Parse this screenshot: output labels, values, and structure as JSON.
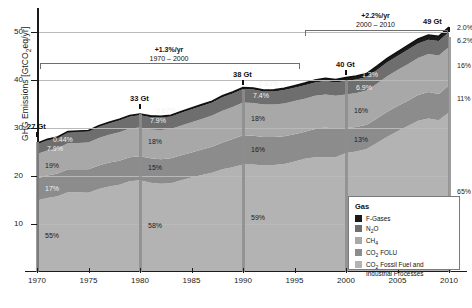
{
  "chart_data": {
    "type": "area",
    "title": "",
    "xlabel": "",
    "ylabel": "GHG Emissions [GtCO2eq/yr]",
    "xlim": [
      1970,
      2010
    ],
    "ylim": [
      0,
      55
    ],
    "yticks": [
      10,
      20,
      30,
      40,
      50
    ],
    "xticks": [
      1970,
      1975,
      1980,
      1985,
      1990,
      1995,
      2000,
      2005,
      2010
    ],
    "grid": true,
    "legend_position": "bottom-right",
    "legend_title": "Gas",
    "series": [
      {
        "name": "CO2 Fossil Fuel and Industrial Processes",
        "color": "#b3b3b3",
        "order": 1
      },
      {
        "name": "CO2 FOLU",
        "color": "#8c8c8c",
        "order": 2
      },
      {
        "name": "CH4",
        "color": "#a8a8a8",
        "order": 3
      },
      {
        "name": "N2O",
        "color": "#6e6e6e",
        "order": 4
      },
      {
        "name": "F-Gases",
        "color": "#1a1a1a",
        "order": 5
      }
    ],
    "totals": [
      {
        "year": 1970,
        "label": "27 Gt",
        "value": 27
      },
      {
        "year": 1980,
        "label": "33 Gt",
        "value": 33
      },
      {
        "year": 1990,
        "label": "38 Gt",
        "value": 38
      },
      {
        "year": 2000,
        "label": "40 Gt",
        "value": 40
      },
      {
        "year": 2010,
        "label": "49 Gt",
        "value": 49
      }
    ],
    "shares": {
      "1970": {
        "fgases": "0.44%",
        "n2o": "7.9%",
        "ch4": "19%",
        "co2folu": "17%",
        "co2ffi": "55%"
      },
      "1980": {
        "fgases": "0.67%",
        "n2o": "7.9%",
        "ch4": "18%",
        "co2folu": "15%",
        "co2ffi": "58%"
      },
      "1990": {
        "fgases": "0.81%",
        "n2o": "7.4%",
        "ch4": "18%",
        "co2folu": "16%",
        "co2ffi": "59%"
      },
      "2000": {
        "fgases": "1.3%",
        "n2o": "6.9%",
        "ch4": "16%",
        "co2folu": "13%",
        "co2ffi": "62%"
      },
      "2010": {
        "fgases": "2.0%",
        "n2o": "6.2%",
        "ch4": "16%",
        "co2folu": "11%",
        "co2ffi": "65%"
      }
    },
    "annotations": [
      {
        "rate": "+1.3%/yr",
        "period": "1970 – 2000"
      },
      {
        "rate": "+2.2%/yr",
        "period": "2000 – 2010"
      }
    ],
    "stack_values": {
      "years": [
        1970,
        1971,
        1972,
        1973,
        1974,
        1975,
        1976,
        1977,
        1978,
        1979,
        1980,
        1981,
        1982,
        1983,
        1984,
        1985,
        1986,
        1987,
        1988,
        1989,
        1990,
        1991,
        1992,
        1993,
        1994,
        1995,
        1996,
        1997,
        1998,
        1999,
        2000,
        2001,
        2002,
        2003,
        2004,
        2005,
        2006,
        2007,
        2008,
        2009,
        2010
      ],
      "co2ffi": [
        14.9,
        15.4,
        15.8,
        16.6,
        16.6,
        16.5,
        17.3,
        17.8,
        18.2,
        18.9,
        19.1,
        18.6,
        18.4,
        18.5,
        19.1,
        19.7,
        20.2,
        20.7,
        21.4,
        21.8,
        22.4,
        22.4,
        22.2,
        22.3,
        22.5,
        23.0,
        23.6,
        23.9,
        23.9,
        23.9,
        24.8,
        25.1,
        25.6,
        26.9,
        28.2,
        29.3,
        30.4,
        31.5,
        32.0,
        31.6,
        33.3
      ],
      "co2folu": [
        4.6,
        4.7,
        4.7,
        4.8,
        4.8,
        4.9,
        4.9,
        5.0,
        5.0,
        5.0,
        5.0,
        5.1,
        5.1,
        5.2,
        5.2,
        5.2,
        5.3,
        5.4,
        5.6,
        5.9,
        6.1,
        6.0,
        5.9,
        5.8,
        5.8,
        5.7,
        5.6,
        5.9,
        6.2,
        5.9,
        5.2,
        5.1,
        5.1,
        5.1,
        5.2,
        5.3,
        5.3,
        5.4,
        5.5,
        5.5,
        5.6
      ],
      "ch4": [
        5.1,
        5.2,
        5.3,
        5.4,
        5.5,
        5.6,
        5.7,
        5.8,
        5.9,
        6.0,
        6.0,
        6.0,
        6.1,
        6.1,
        6.2,
        6.3,
        6.4,
        6.5,
        6.6,
        6.7,
        6.8,
        6.8,
        6.8,
        6.8,
        6.8,
        6.9,
        6.9,
        6.9,
        6.9,
        6.9,
        7.0,
        7.1,
        7.1,
        7.2,
        7.4,
        7.5,
        7.6,
        7.7,
        7.9,
        8.0,
        8.0
      ],
      "n2o": [
        2.1,
        2.2,
        2.2,
        2.3,
        2.3,
        2.3,
        2.4,
        2.4,
        2.5,
        2.5,
        2.6,
        2.6,
        2.6,
        2.6,
        2.7,
        2.7,
        2.7,
        2.7,
        2.8,
        2.8,
        2.8,
        2.8,
        2.7,
        2.7,
        2.8,
        2.8,
        2.8,
        2.8,
        2.8,
        2.8,
        2.8,
        2.8,
        2.8,
        2.9,
        2.9,
        2.9,
        3.0,
        3.0,
        3.0,
        3.0,
        3.1
      ],
      "fgases": [
        0.12,
        0.13,
        0.14,
        0.15,
        0.16,
        0.17,
        0.18,
        0.19,
        0.2,
        0.21,
        0.22,
        0.23,
        0.24,
        0.25,
        0.26,
        0.27,
        0.28,
        0.29,
        0.3,
        0.3,
        0.31,
        0.32,
        0.33,
        0.34,
        0.36,
        0.4,
        0.45,
        0.5,
        0.55,
        0.62,
        0.7,
        0.72,
        0.74,
        0.78,
        0.82,
        0.86,
        0.9,
        0.94,
        0.97,
        0.98,
        1.0
      ]
    }
  }
}
